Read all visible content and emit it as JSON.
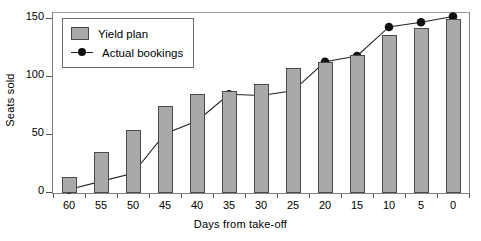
{
  "chart_data": {
    "type": "bar",
    "title": "",
    "xlabel": "Days from take-off",
    "ylabel": "Seats sold",
    "categories": [
      "60",
      "55",
      "50",
      "45",
      "40",
      "35",
      "30",
      "25",
      "20",
      "15",
      "10",
      "5",
      "0"
    ],
    "xlim": [
      60,
      0
    ],
    "ylim": [
      0,
      155
    ],
    "yticks": [
      0,
      50,
      100,
      150
    ],
    "ytick_labels": [
      "0",
      "50",
      "100",
      "150"
    ],
    "grid": false,
    "legend_position": "top-left",
    "series": [
      {
        "name": "Yield plan",
        "render": "bar",
        "color": "#a9a9a9",
        "edge_color": "#4a4a4a",
        "values": [
          14,
          35,
          54,
          75,
          85,
          88,
          94,
          108,
          113,
          119,
          136,
          142,
          150
        ]
      },
      {
        "name": "Actual bookings",
        "render": "line+marker",
        "color": "#111111",
        "values": [
          3,
          10,
          17,
          51,
          62,
          85,
          84,
          88,
          113,
          118,
          143,
          147,
          152
        ]
      }
    ]
  },
  "legend": {
    "items": [
      {
        "label": "Yield plan",
        "marker": "filled-square-swatch"
      },
      {
        "label": "Actual bookings",
        "marker": "line-with-dot-swatch"
      }
    ]
  },
  "axes": {
    "y_title": "Seats sold",
    "x_title": "Days from take-off"
  }
}
